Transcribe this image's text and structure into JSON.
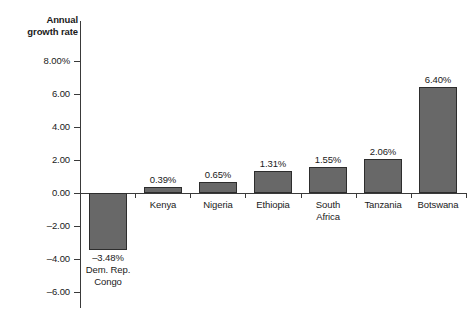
{
  "chart_data": {
    "type": "bar",
    "title": "",
    "subtitle": "",
    "xlabel": "",
    "ylabel": "Annual\ngrowth rate",
    "ylim": [
      -6.0,
      8.0
    ],
    "ytick_labels": [
      "8.00%",
      "6.00",
      "4.00",
      "2.00",
      "0.00",
      "-2.00",
      "-4.00",
      "-6.00"
    ],
    "ytick_values": [
      8.0,
      6.0,
      4.0,
      2.0,
      0.0,
      -2.0,
      -4.0,
      -6.0
    ],
    "grid": false,
    "legend": "none",
    "categories": [
      "Dem. Rep.\nCongo",
      "Kenya",
      "Nigeria",
      "Ethiopia",
      "South\nAfrica",
      "Tanzania",
      "Botswana"
    ],
    "values": [
      -3.48,
      0.39,
      0.65,
      1.31,
      1.55,
      2.06,
      6.4
    ],
    "value_labels": [
      "-3.48%",
      "0.39%",
      "0.65%",
      "1.31%",
      "1.55%",
      "2.06%",
      "6.40%"
    ],
    "bar_color": "#686868",
    "bar_border_color": "#2d2d2d",
    "axis_color": "#3a3a3a",
    "background_color": "#ffffff"
  }
}
